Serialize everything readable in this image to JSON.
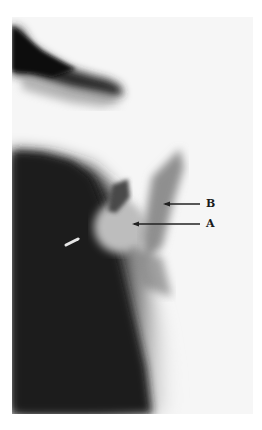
{
  "figure": {
    "annotations": [
      {
        "label": "B",
        "arrow_from": [
          200,
          204
        ],
        "arrow_to": [
          163,
          204
        ]
      },
      {
        "label": "A",
        "arrow_from": [
          200,
          224
        ],
        "arrow_to": [
          132,
          224
        ]
      }
    ],
    "colors": {
      "background": "#ffffff",
      "film_light": "#f4f4f4",
      "film_dark": "#1e1e1e",
      "arrow": "#222222"
    }
  }
}
